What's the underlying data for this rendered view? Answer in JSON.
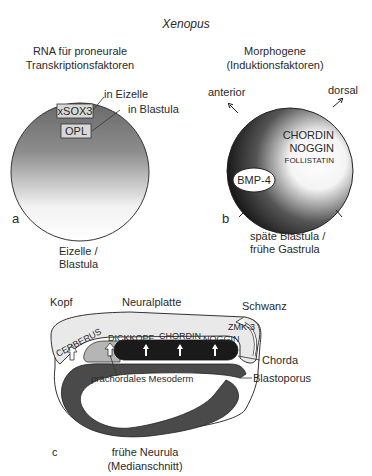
{
  "title": "Xenopus",
  "panel_a": {
    "letter": "a",
    "heading_line1": "RNA für proneurale",
    "heading_line2": "Transkriptionsfaktoren",
    "label_in_eizelle": "in Eizelle",
    "label_in_blastula": "in Blastula",
    "box_xsox3": "xSOX3",
    "box_opl": "OPL",
    "caption_line1": "Eizelle /",
    "caption_line2": "Blastula"
  },
  "panel_b": {
    "letter": "b",
    "heading_line1": "Morphogene",
    "heading_line2": "(Induktionsfaktoren)",
    "axis_anterior": "anterior",
    "axis_dorsal": "dorsal",
    "factor_chordin": "CHORDIN",
    "factor_noggin": "NOGGIN",
    "factor_follistatin": "FOLLISTATIN",
    "factor_bmp4": "BMP-4",
    "caption_line1": "späte Blastula /",
    "caption_line2": "frühe Gastrula"
  },
  "panel_c": {
    "letter": "c",
    "label_kopf": "Kopf",
    "label_neuralplatte": "Neuralplatte",
    "label_schwanz": "Schwanz",
    "label_zmk3": "ZMK-3",
    "label_cerberus": "CERBERUS",
    "label_dickkopf": "DICKKOPF",
    "label_chordin": "CHORDIN",
    "label_noggin": "NOGGIN",
    "label_chorda": "Chorda",
    "label_blastoporus": "Blastoporus",
    "label_mesoderm": "prächordales Mesoderm",
    "caption_line1": "frühe Neurula",
    "caption_line2": "(Medianschnitt)"
  }
}
